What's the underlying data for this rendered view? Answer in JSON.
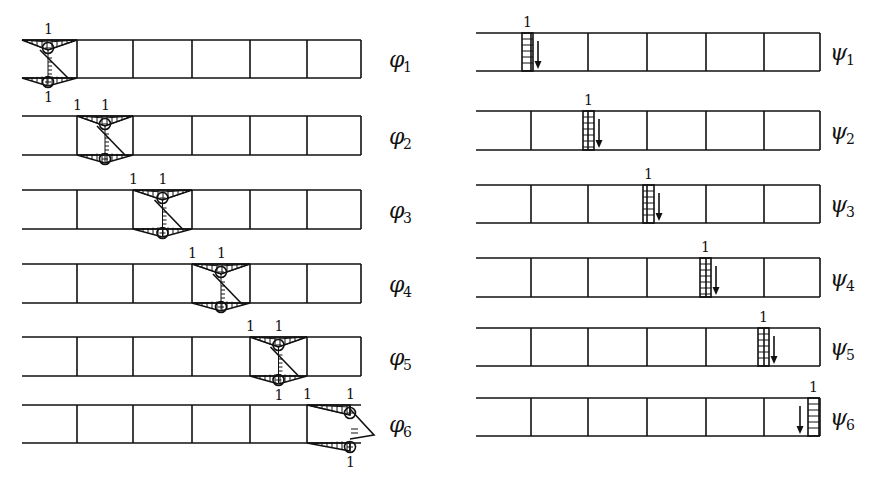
{
  "figure": {
    "left_column": {
      "description": "Generalized strain modes phi_i of a 6-cell thin-walled box beam",
      "cell_count": 6,
      "rows": [
        {
          "symbol": "φ",
          "subscript": "1",
          "active_cell": 1,
          "label_top": "1",
          "label_bottom": "1",
          "sign_top": "−",
          "sign_bottom": "+"
        },
        {
          "symbol": "φ",
          "subscript": "2",
          "active_cell": 2,
          "label_left": "1",
          "label_top": "1",
          "sign_top": "−",
          "sign_bottom": "+"
        },
        {
          "symbol": "φ",
          "subscript": "3",
          "active_cell": 3,
          "label_left": "1",
          "label_top": "1",
          "sign_top": "−",
          "sign_bottom": "+"
        },
        {
          "symbol": "φ",
          "subscript": "4",
          "active_cell": 4,
          "label_left": "1",
          "label_top": "1",
          "sign_top": "−",
          "sign_bottom": "+"
        },
        {
          "symbol": "φ",
          "subscript": "5",
          "active_cell": 5,
          "label_left": "1",
          "label_top": "1",
          "label_bottom": "1",
          "sign_top": "−",
          "sign_bottom": "+"
        },
        {
          "symbol": "φ",
          "subscript": "6",
          "active_cell": 6,
          "label_left": "1",
          "label_top": "1",
          "label_bottom": "1",
          "sign_top": "−",
          "sign_bottom": "+"
        }
      ]
    },
    "right_column": {
      "description": "Shear/web displacement modes psi_i with unit load arrow",
      "cell_count": 6,
      "rows": [
        {
          "symbol": "ψ",
          "subscript": "1",
          "web_index": 1,
          "load_label": "1"
        },
        {
          "symbol": "ψ",
          "subscript": "2",
          "web_index": 2,
          "load_label": "1"
        },
        {
          "symbol": "ψ",
          "subscript": "3",
          "web_index": 3,
          "load_label": "1"
        },
        {
          "symbol": "ψ",
          "subscript": "4",
          "web_index": 4,
          "load_label": "1"
        },
        {
          "symbol": "ψ",
          "subscript": "5",
          "web_index": 5,
          "load_label": "1"
        },
        {
          "symbol": "ψ",
          "subscript": "6",
          "web_index": 6,
          "load_label": "1"
        }
      ]
    }
  }
}
